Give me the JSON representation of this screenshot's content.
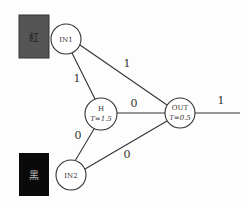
{
  "inputs": [
    {
      "id": "IN1",
      "label": "IN1",
      "swatch_text": "紅",
      "swatch_color": "#555555",
      "swatch_text_color": "#222222"
    },
    {
      "id": "IN2",
      "label": "IN2",
      "swatch_text": "黑",
      "swatch_color": "#0a0a0a",
      "swatch_text_color": "#bbbbbb"
    }
  ],
  "hidden": {
    "label": "H",
    "threshold": "T=1.5"
  },
  "output": {
    "label": "OUT",
    "threshold": "T=0.5"
  },
  "weights": {
    "in1_h": "1",
    "in1_out": "1",
    "in2_h": "0",
    "in2_out": "0",
    "h_out": "0",
    "out": "1"
  }
}
